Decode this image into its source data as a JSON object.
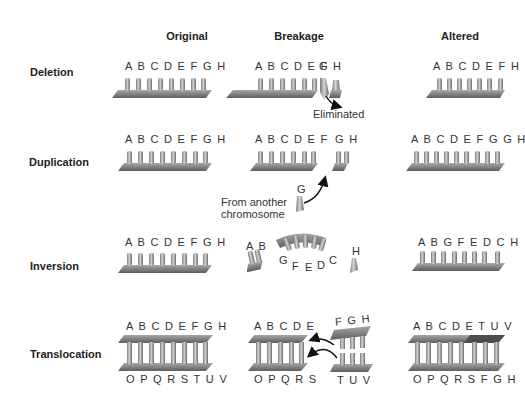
{
  "columns": [
    "Original",
    "Breakage",
    "Altered"
  ],
  "rows": [
    {
      "label": "Deletion",
      "original": "A B C D E F G H",
      "breakage": {
        "main": "A B C D E F",
        "g": "G",
        "h": "H",
        "note": "Eliminated"
      },
      "altered": "A B C D E F H"
    },
    {
      "label": "Duplication",
      "original": "A B C D E F G H",
      "breakage": {
        "main": "A B C D E F",
        "gh": "G H",
        "g": "G",
        "note": "From another chromosome"
      },
      "altered": "A B C D E F G G H"
    },
    {
      "label": "Inversion",
      "original": "A B C D E F G H",
      "breakage": {
        "ab": "A B",
        "g": "G",
        "f": "F",
        "e": "E",
        "d": "D",
        "c": "C",
        "h": "H"
      },
      "altered": "A B G F E D C H"
    },
    {
      "label": "Translocation",
      "original": {
        "top": "A B C D E F G H",
        "bottom": "O P Q R S T U V"
      },
      "breakage": {
        "top": "A B C D E",
        "bottom": "O P Q R S",
        "frag_top": "F G H",
        "frag_bottom": "T U V"
      },
      "altered": {
        "top": "A B C D E T U V",
        "bottom": "O P Q R S F G H"
      }
    }
  ],
  "colors": {
    "chromosome_light": "#b8b8b8",
    "chromosome_dark": "#6e6e6e",
    "text": "#222222",
    "arrow": "#111111"
  }
}
